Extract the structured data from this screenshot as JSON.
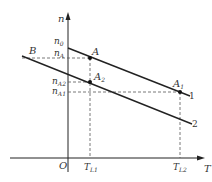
{
  "diagram": {
    "axes": {
      "y_label": "n",
      "x_label": "T",
      "origin_label": "O"
    },
    "y_ticks": [
      "n0",
      "nA",
      "nA2",
      "nA1"
    ],
    "y_tick_display": {
      "n0": {
        "base": "n",
        "sub": "0"
      },
      "nA": {
        "base": "n",
        "sub": "A"
      },
      "nA2": {
        "base": "n",
        "sub": "A2"
      },
      "nA1": {
        "base": "n",
        "sub": "A1"
      }
    },
    "x_ticks": {
      "TL1": {
        "base": "T",
        "sub": "L1"
      },
      "TL2": {
        "base": "T",
        "sub": "L2"
      }
    },
    "points": {
      "A": {
        "base": "A",
        "sub": ""
      },
      "A1": {
        "base": "A",
        "sub": "1"
      },
      "A2": {
        "base": "A",
        "sub": "2"
      },
      "B": {
        "base": "B",
        "sub": ""
      }
    },
    "lines": {
      "line1": "1",
      "line2": "2"
    },
    "colors": {
      "line": "#222222",
      "dash": "#555555"
    }
  }
}
